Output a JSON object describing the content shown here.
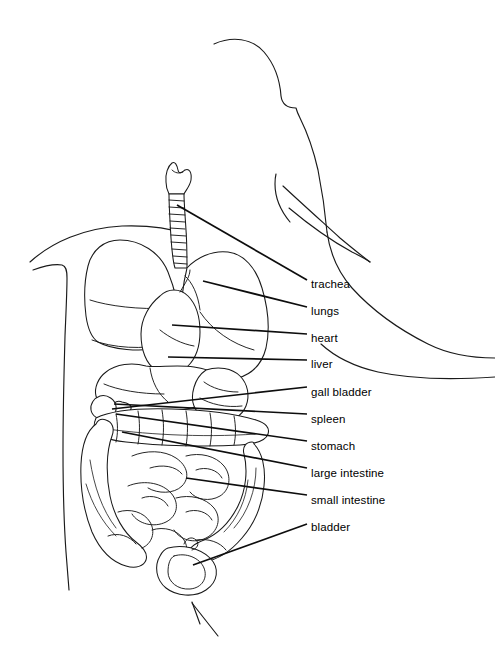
{
  "diagram": {
    "view": "lateral profile, facing right",
    "stroke_color": "#1a1a1a",
    "background_color": "#ffffff",
    "label_color": "#000000"
  },
  "labels": [
    {
      "id": "trachea",
      "text": "trachea",
      "x": 311,
      "y": 278,
      "leader": {
        "x1": 177,
        "y1": 205,
        "x2": 307,
        "y2": 280
      }
    },
    {
      "id": "lungs",
      "text": "lungs",
      "x": 311,
      "y": 305,
      "leader": {
        "x1": 203,
        "y1": 281,
        "x2": 307,
        "y2": 307
      }
    },
    {
      "id": "heart",
      "text": "heart",
      "x": 311,
      "y": 332,
      "leader": {
        "x1": 172,
        "y1": 325,
        "x2": 307,
        "y2": 334
      }
    },
    {
      "id": "liver",
      "text": "liver",
      "x": 311,
      "y": 358,
      "leader": {
        "x1": 168,
        "y1": 357,
        "x2": 307,
        "y2": 360
      }
    },
    {
      "id": "gall-bladder",
      "text": "gall bladder",
      "x": 311,
      "y": 386,
      "leader": {
        "x1": 112,
        "y1": 409,
        "x2": 307,
        "y2": 387
      }
    },
    {
      "id": "spleen",
      "text": "spleen",
      "x": 311,
      "y": 413,
      "leader": {
        "x1": 114,
        "y1": 404,
        "x2": 307,
        "y2": 414
      }
    },
    {
      "id": "stomach",
      "text": "stomach",
      "x": 311,
      "y": 440,
      "leader": {
        "x1": 116,
        "y1": 414,
        "x2": 307,
        "y2": 441
      }
    },
    {
      "id": "large-intestine",
      "text": "large intestine",
      "x": 311,
      "y": 467,
      "leader": {
        "x1": 122,
        "y1": 432,
        "x2": 307,
        "y2": 468
      }
    },
    {
      "id": "small-intestine",
      "text": "small intestine",
      "x": 311,
      "y": 494,
      "leader": {
        "x1": 186,
        "y1": 478,
        "x2": 307,
        "y2": 495
      }
    },
    {
      "id": "bladder",
      "text": "bladder",
      "x": 311,
      "y": 521,
      "leader": {
        "x1": 193,
        "y1": 565,
        "x2": 307,
        "y2": 524
      }
    }
  ]
}
